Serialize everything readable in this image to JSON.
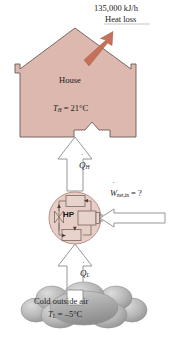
{
  "figure": {
    "type": "thermodynamics-heat-pump-schematic",
    "colors": {
      "house_fill": "#dcb8ae",
      "house_stroke": "#6b5a55",
      "arrow_fill": "#ffffff",
      "arrow_stroke": "#8a8a8a",
      "heat_loss_arrow": "#c4705a",
      "hp_circle_fill": "#e6cdc6",
      "hp_circle_stroke": "#b08a80",
      "component_fill": "#e8d3cc",
      "component_stroke": "#7a6660",
      "cloud_fill": "#b4b4b4",
      "cloud_stroke": "#8f8f8f",
      "text": "#1a1a1a"
    }
  },
  "labels": {
    "heat_loss_value": "135,000 kJ/h",
    "heat_loss_caption": "Heat loss",
    "house": "House",
    "house_temp_symbol": "T",
    "house_temp_sub": "H",
    "house_temp_value": "= 21°C",
    "q_high_symbol": "Q",
    "q_high_sub": "H",
    "heat_pump": "HP",
    "work_symbol": "W",
    "work_sub": "net,in",
    "work_value": "= ?",
    "q_low_symbol": "Q",
    "q_low_sub": "L",
    "cold_air": "Cold outside air",
    "cold_temp_symbol": "T",
    "cold_temp_sub": "L",
    "cold_temp_value": "= –5°C",
    "dot_accent": "˙"
  }
}
